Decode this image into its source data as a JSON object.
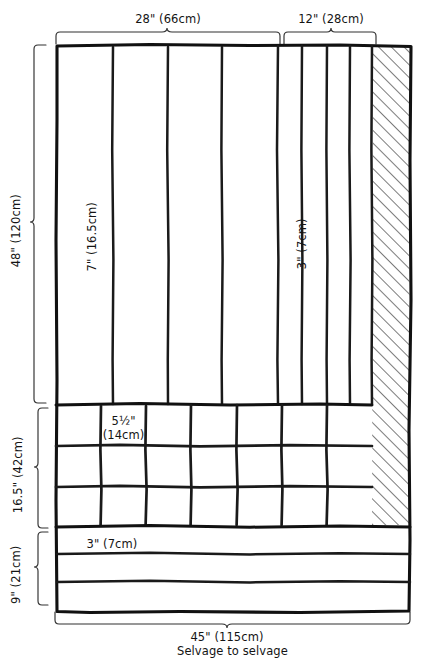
{
  "diagram": {
    "ink_color": "#1a1a1a",
    "background_color": "#ffffff",
    "measurements": {
      "top_wide_group": "28\" (66cm)",
      "top_narrow_group": "12\" (28cm)",
      "wide_strip": "7\" (16.5cm)",
      "narrow_strip": "3\" (7cm)",
      "square_block": "5½\"",
      "square_block_metric": "(14cm)",
      "bottom_strip": "3\" (7cm)",
      "left_top_section": "48\" (120cm)",
      "left_middle_section": "16.5\" (42cm)",
      "left_bottom_section": "9\" (21cm)",
      "bottom_width": "45\" (115cm)",
      "bottom_note": "Selvage to selvage"
    },
    "sections": {
      "top_strips": {
        "name": "vertical-strip-section",
        "wide_strip_count": 4,
        "narrow_strip_count": 4,
        "wide_label": "7\" (16.5cm)",
        "narrow_label": "3\" (7cm)"
      },
      "grid_squares": {
        "name": "square-block-section",
        "columns": 7,
        "rows": 3,
        "cell_label_line1": "5½\"",
        "cell_label_line2": "(14cm)"
      },
      "bottom_strips": {
        "name": "horizontal-strip-section",
        "count": 3,
        "label": "3\" (7cm)"
      },
      "selvage": {
        "name": "selvage-hatched-area",
        "hatch": "diagonal"
      }
    }
  }
}
